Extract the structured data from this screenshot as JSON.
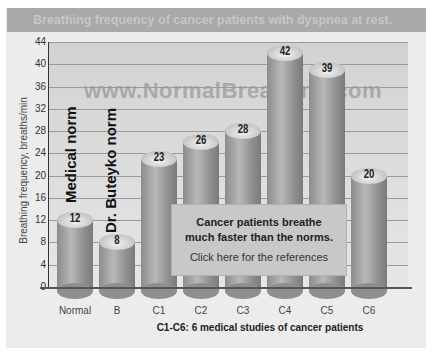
{
  "title": "Breathing frequency of cancer patients with dyspnea at rest.",
  "watermark": "www.NormalBreathing.com",
  "annotations": {
    "medical_norm": "Medical norm",
    "buteyko_norm": "Dr. Buteyko norm"
  },
  "callout": {
    "line1": "Cancer patients breathe",
    "line2": "much faster than the norms.",
    "link": "Click here for the references"
  },
  "chart_data": {
    "type": "bar",
    "title": "Breathing frequency of cancer patients with dyspnea at rest.",
    "xlabel": "C1-C6: 6 medical studies of cancer patients",
    "ylabel": "Breathing frequency, breaths/min",
    "categories": [
      "Normal",
      "B",
      "C1",
      "C2",
      "C3",
      "C4",
      "C5",
      "C6"
    ],
    "values": [
      12,
      8,
      23,
      26,
      28,
      42,
      39,
      20
    ],
    "value_labels": [
      "12",
      "8",
      "23",
      "26",
      "28",
      "42",
      "39",
      "20"
    ],
    "ylim": [
      0,
      44
    ],
    "yticks": [
      "0",
      "4",
      "8",
      "12",
      "16",
      "20",
      "24",
      "28",
      "32",
      "36",
      "40",
      "44"
    ],
    "grid": true,
    "legend": "none",
    "style": "3D cylinder bars, grayscale"
  }
}
